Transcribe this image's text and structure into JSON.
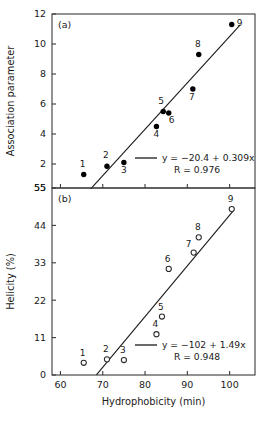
{
  "figure": {
    "width": 270,
    "height": 421,
    "background": "#ffffff",
    "ink_color": "#1a1a1a"
  },
  "chart_data": [
    {
      "type": "scatter",
      "panel_label": "(a)",
      "title": "",
      "xlabel": "",
      "ylabel": "Association parameter",
      "xlim": [
        58,
        106
      ],
      "ylim": [
        0.4,
        12
      ],
      "xticks": [
        60,
        70,
        80,
        90,
        100
      ],
      "xticklabels": [
        "",
        "",
        "",
        "",
        ""
      ],
      "yticks": [
        2,
        4,
        6,
        8,
        10,
        12
      ],
      "yticklabels": [
        "2",
        "4",
        "6",
        "8",
        "10",
        "12"
      ],
      "bottom_axis_label": "55",
      "grid": false,
      "marker": "filled-circle",
      "x": [
        65.5,
        71.0,
        75.0,
        82.7,
        84.3,
        85.6,
        91.3,
        92.7,
        100.5
      ],
      "y": [
        1.3,
        1.85,
        2.1,
        4.5,
        5.5,
        5.4,
        7.0,
        9.3,
        11.3
      ],
      "point_labels": [
        "1",
        "2",
        "3",
        "4",
        "5",
        "6",
        "7",
        "8",
        "9"
      ],
      "label_offsets": [
        {
          "dx": -1,
          "dy": -8
        },
        {
          "dx": -1,
          "dy": -8
        },
        {
          "dx": 0,
          "dy": 10
        },
        {
          "dx": 0,
          "dy": 10
        },
        {
          "dx": -2,
          "dy": -8
        },
        {
          "dx": 3,
          "dy": 10
        },
        {
          "dx": -1,
          "dy": 11
        },
        {
          "dx": -1,
          "dy": -8
        },
        {
          "dx": 8,
          "dy": 1
        }
      ],
      "fit": {
        "slope": 0.309,
        "intercept": -20.4,
        "x_start": 67.2,
        "x_end": 102.5
      },
      "legend": {
        "position": "lower-right",
        "equation": "y = −20.4 + 0.309x",
        "correlation": "R = 0.976"
      }
    },
    {
      "type": "scatter",
      "panel_label": "(b)",
      "title": "",
      "xlabel": "Hydrophobicity (min)",
      "ylabel": "Helicity (%)",
      "xlim": [
        58,
        106
      ],
      "ylim": [
        0,
        55
      ],
      "xticks": [
        60,
        70,
        80,
        90,
        100
      ],
      "xticklabels": [
        "60",
        "70",
        "80",
        "90",
        "100"
      ],
      "yticks": [
        0,
        11,
        22,
        33,
        44,
        55
      ],
      "yticklabels": [
        "0",
        "11",
        "22",
        "33",
        "44",
        "55"
      ],
      "grid": false,
      "marker": "open-circle",
      "x": [
        65.5,
        71.0,
        75.0,
        82.7,
        84.0,
        85.6,
        91.5,
        92.7,
        100.5
      ],
      "y": [
        3.6,
        4.6,
        4.4,
        12.0,
        17.2,
        31.2,
        36.0,
        40.5,
        48.8
      ],
      "point_labels": [
        "1",
        "2",
        "3",
        "4",
        "5",
        "6",
        "7",
        "8",
        "9"
      ],
      "label_offsets": [
        {
          "dx": -1,
          "dy": -7
        },
        {
          "dx": -1,
          "dy": -7
        },
        {
          "dx": -1,
          "dy": -7
        },
        {
          "dx": -1,
          "dy": -7
        },
        {
          "dx": -1,
          "dy": -7
        },
        {
          "dx": -1,
          "dy": -7
        },
        {
          "dx": -5,
          "dy": -6
        },
        {
          "dx": -1,
          "dy": -7
        },
        {
          "dx": -1,
          "dy": -7
        }
      ],
      "fit": {
        "slope": 1.49,
        "intercept": -102,
        "x_start": 68.5,
        "x_end": 100.8
      },
      "legend": {
        "position": "lower-right",
        "equation": "y = −102 + 1.49x",
        "correlation": "R = 0.948"
      }
    }
  ]
}
